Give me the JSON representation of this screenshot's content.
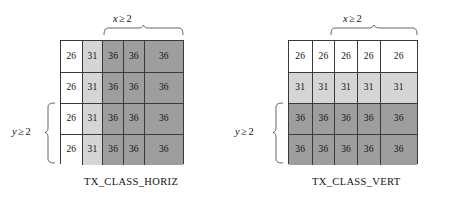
{
  "figure": {
    "panels": [
      {
        "id": "tx-class-horiz",
        "caption": "TX_CLASS_HORIZ",
        "x_label": {
          "var": "x",
          "rel": "≥",
          "val": "2"
        },
        "y_label": {
          "var": "y",
          "rel": "≥",
          "val": "2"
        },
        "columns": 5,
        "rows": 4,
        "cells": [
          [
            {
              "value": "26",
              "shade": "white"
            },
            {
              "value": "31",
              "shade": "light"
            },
            {
              "value": "36",
              "shade": "dark"
            },
            {
              "value": "36",
              "shade": "dark"
            },
            {
              "value": "36",
              "shade": "dark"
            }
          ],
          [
            {
              "value": "26",
              "shade": "white"
            },
            {
              "value": "31",
              "shade": "light"
            },
            {
              "value": "36",
              "shade": "dark"
            },
            {
              "value": "36",
              "shade": "dark"
            },
            {
              "value": "36",
              "shade": "dark"
            }
          ],
          [
            {
              "value": "26",
              "shade": "white"
            },
            {
              "value": "31",
              "shade": "light"
            },
            {
              "value": "36",
              "shade": "dark"
            },
            {
              "value": "36",
              "shade": "dark"
            },
            {
              "value": "36",
              "shade": "dark"
            }
          ],
          [
            {
              "value": "26",
              "shade": "white"
            },
            {
              "value": "31",
              "shade": "light"
            },
            {
              "value": "36",
              "shade": "dark"
            },
            {
              "value": "36",
              "shade": "dark"
            },
            {
              "value": "36",
              "shade": "dark"
            }
          ]
        ]
      },
      {
        "id": "tx-class-vert",
        "caption": "TX_CLASS_VERT",
        "x_label": {
          "var": "x",
          "rel": "≥",
          "val": "2"
        },
        "y_label": {
          "var": "y",
          "rel": "≥",
          "val": "2"
        },
        "columns": 5,
        "rows": 4,
        "cells": [
          [
            {
              "value": "26",
              "shade": "white"
            },
            {
              "value": "26",
              "shade": "white"
            },
            {
              "value": "26",
              "shade": "white"
            },
            {
              "value": "26",
              "shade": "white"
            },
            {
              "value": "26",
              "shade": "white"
            }
          ],
          [
            {
              "value": "31",
              "shade": "light"
            },
            {
              "value": "31",
              "shade": "light"
            },
            {
              "value": "31",
              "shade": "light"
            },
            {
              "value": "31",
              "shade": "light"
            },
            {
              "value": "31",
              "shade": "light"
            }
          ],
          [
            {
              "value": "36",
              "shade": "dark"
            },
            {
              "value": "36",
              "shade": "dark"
            },
            {
              "value": "36",
              "shade": "dark"
            },
            {
              "value": "36",
              "shade": "dark"
            },
            {
              "value": "36",
              "shade": "dark"
            }
          ],
          [
            {
              "value": "36",
              "shade": "dark"
            },
            {
              "value": "36",
              "shade": "dark"
            },
            {
              "value": "36",
              "shade": "dark"
            },
            {
              "value": "36",
              "shade": "dark"
            },
            {
              "value": "36",
              "shade": "dark"
            }
          ]
        ]
      }
    ],
    "colors": {
      "white": "#ffffff",
      "light": "#d5d5d5",
      "dark": "#9e9e9e",
      "stroke": "#3a3a3a",
      "brace": "#555555",
      "text": "#111111"
    }
  }
}
